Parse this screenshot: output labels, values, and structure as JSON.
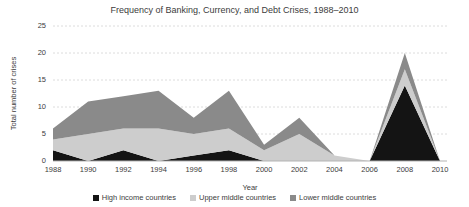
{
  "chart_data": {
    "type": "area",
    "stacked": true,
    "title": "Frequency of Banking, Currency, and Debt Crises, 1988–2010",
    "xlabel": "Year",
    "ylabel": "Total number of crises",
    "x": [
      1988,
      1990,
      1992,
      1994,
      1996,
      1998,
      2000,
      2002,
      2004,
      2006,
      2008,
      2010
    ],
    "series": [
      {
        "name": "High income countries",
        "color": "#141414",
        "values": [
          2,
          0,
          2,
          0,
          1,
          2,
          0,
          0,
          0,
          0,
          14,
          0
        ]
      },
      {
        "name": "Upper middle countries",
        "color": "#cdcdcd",
        "values": [
          2,
          5,
          4,
          6,
          4,
          4,
          2,
          5,
          1,
          0,
          3,
          0
        ]
      },
      {
        "name": "Lower middle countries",
        "color": "#8a8a8a",
        "values": [
          2,
          6,
          6,
          7,
          3,
          7,
          1,
          3,
          0,
          0,
          3,
          0
        ]
      }
    ],
    "xlim": [
      1988,
      2010
    ],
    "ylim": [
      0,
      25
    ],
    "yticks": [
      0,
      5,
      10,
      15,
      20,
      25
    ],
    "xticks": [
      1988,
      1990,
      1992,
      1994,
      1996,
      1998,
      2000,
      2002,
      2004,
      2006,
      2008,
      2010
    ],
    "grid": "horizontal-dashed",
    "legend_position": "bottom"
  },
  "colors": {
    "background": "#ffffff",
    "text": "#3c3c3c",
    "gridline": "#dcdcdc",
    "axis_line": "#b3b3b3"
  }
}
